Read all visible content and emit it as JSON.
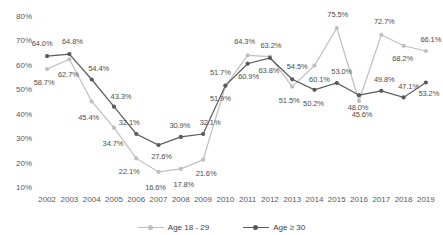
{
  "chart_data": {
    "type": "line",
    "title": "",
    "xlabel": "",
    "ylabel": "",
    "ylim": [
      10,
      80
    ],
    "ytick_labels": [
      "80%",
      "70%",
      "60%",
      "50%",
      "40%",
      "30%",
      "20%",
      "10%"
    ],
    "ytick_values": [
      80,
      70,
      60,
      50,
      40,
      30,
      20,
      10
    ],
    "grid": false,
    "legend_position": "bottom",
    "categories": [
      "2002",
      "2003",
      "2004",
      "2005",
      "2006",
      "2007",
      "2008",
      "2009",
      "2010",
      "2011",
      "2012",
      "2013",
      "2014",
      "2015",
      "2016",
      "2017",
      "2018",
      "2019"
    ],
    "series": [
      {
        "name": "Age 18 - 29",
        "color": "#bfbfbf",
        "values": [
          58.7,
          62.7,
          45.4,
          34.7,
          22.1,
          16.6,
          17.8,
          21.6,
          51.7,
          64.3,
          63.8,
          51.5,
          60.1,
          75.5,
          45.6,
          72.7,
          68.2,
          66.1
        ],
        "labels": [
          "58.7%",
          "62.7%",
          "45.4%",
          "34.7%",
          "22.1%",
          "16.6%",
          "17.8%",
          "21.6%",
          "51.7%",
          "64.3%",
          "63.8%",
          "51.5%",
          "60.1%",
          "75.5%",
          "45.6%",
          "72.7%",
          "68.2%",
          "66.1%"
        ]
      },
      {
        "name": "Age ≥ 30",
        "color": "#595959",
        "values": [
          64.0,
          64.8,
          54.4,
          43.3,
          32.1,
          27.6,
          30.9,
          32.1,
          51.9,
          60.9,
          63.2,
          54.5,
          50.2,
          53.0,
          48.0,
          49.8,
          47.1,
          53.2
        ],
        "labels": [
          "64.0%",
          "64.8%",
          "54.4%",
          "43.3%",
          "32.1%",
          "27.6%",
          "30.9%",
          "32.1%",
          "51.9%",
          "60.9%",
          "63.2%",
          "54.5%",
          "50.2%",
          "53.0%",
          "48.0%",
          "49.8%",
          "47.1%",
          "53.2%"
        ]
      }
    ]
  },
  "legend": {
    "items": [
      {
        "label": "Age 18 - 29"
      },
      {
        "label": "Age ≥ 30"
      }
    ]
  }
}
